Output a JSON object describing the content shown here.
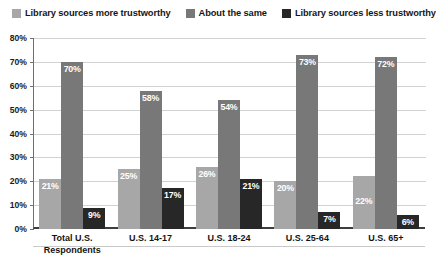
{
  "chart_data": {
    "type": "bar",
    "title": "",
    "subtitle": "",
    "xlabel": "",
    "ylabel": "",
    "ylim": [
      0,
      80
    ],
    "ytick_step": 10,
    "ytick_labels": [
      "80%",
      "70%",
      "60%",
      "50%",
      "40%",
      "30%",
      "20%",
      "10%",
      "0%"
    ],
    "ytick_values": [
      80,
      70,
      60,
      50,
      40,
      30,
      20,
      10,
      0
    ],
    "grid": true,
    "legend_position": "top",
    "categories": [
      "Total U.S. Respondents",
      "U.S. 14-17",
      "U.S. 18-24",
      "U.S. 25-64",
      "U.S. 65+"
    ],
    "category_lines": [
      [
        "Total U.S.",
        "Respondents"
      ],
      [
        "U.S. 14-17"
      ],
      [
        "U.S. 18-24"
      ],
      [
        "U.S. 25-64"
      ],
      [
        "U.S. 65+"
      ]
    ],
    "series": [
      {
        "name": "Library sources more trustworthy",
        "color": "#a7a7a7",
        "values": [
          21,
          25,
          26,
          20,
          22
        ],
        "labels": [
          "21%",
          "25%",
          "26%",
          "20%",
          "22%"
        ]
      },
      {
        "name": "About the same",
        "color": "#787878",
        "values": [
          70,
          58,
          54,
          73,
          72
        ],
        "labels": [
          "70%",
          "58%",
          "54%",
          "73%",
          "72%"
        ]
      },
      {
        "name": "Library sources less trustworthy",
        "color": "#272727",
        "values": [
          9,
          17,
          21,
          7,
          6
        ],
        "labels": [
          "9%",
          "17%",
          "21%",
          "7%",
          "6%"
        ]
      }
    ]
  },
  "legend": {
    "items": [
      {
        "label": "Library sources more trustworthy",
        "color": "#a7a7a7"
      },
      {
        "label": "About the same",
        "color": "#787878"
      },
      {
        "label": "Library sources less trustworthy",
        "color": "#272727"
      }
    ]
  }
}
